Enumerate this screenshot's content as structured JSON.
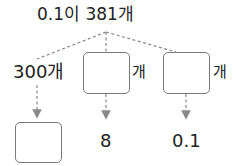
{
  "diagram": {
    "root": {
      "text": "0.1이 381개"
    },
    "branches": [
      {
        "label": "300개",
        "value": "",
        "result": ""
      },
      {
        "label": "",
        "unit": "개",
        "result": "8"
      },
      {
        "label": "",
        "unit": "개",
        "result": "0.1"
      }
    ]
  },
  "colors": {
    "line": "#8a8a8a",
    "box_border": "#7a7a7a",
    "text": "#222222"
  }
}
